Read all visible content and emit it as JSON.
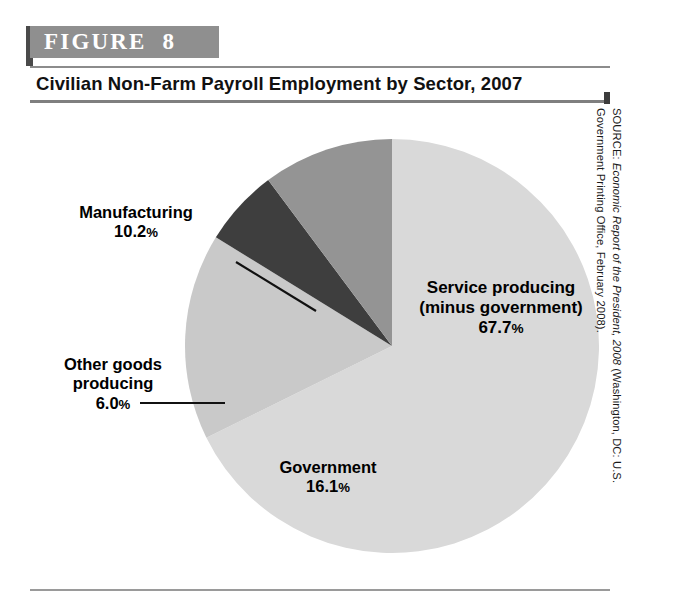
{
  "figure": {
    "banner_label": "FIGURE  8",
    "title": "Civilian Non-Farm Payroll Employment by Sector, 2007"
  },
  "source": {
    "prefix": "SOURCE: ",
    "italic_title": "Economic Report of the President, 2008",
    "rest_line1": " (Washington, DC: U.S.",
    "line2": "Government Printing Office, February 2008)."
  },
  "labels": {
    "service": {
      "line1": "Service producing",
      "line2": "(minus government)",
      "value": "67.7",
      "pct": "%"
    },
    "government": {
      "line1": "Government",
      "value": "16.1",
      "pct": "%"
    },
    "manufacturing": {
      "line1": "Manufacturing",
      "value": "10.2",
      "pct": "%"
    },
    "other_goods": {
      "line1": "Other goods",
      "line2": "producing",
      "value": "6.0",
      "pct": "%"
    }
  },
  "colors": {
    "service": "#d9d9d9",
    "government": "#c9c9c9",
    "other_goods": "#3e3e3e",
    "manufacturing": "#949494",
    "banner_bg": "#8f8f8f",
    "banner_text": "#ffffff",
    "rule": "#8c8c8c"
  },
  "chart_data": {
    "type": "pie",
    "title": "Civilian Non-Farm Payroll Employment by Sector, 2007",
    "xlabel": "",
    "ylabel": "",
    "units": "percent",
    "start_angle_deg": 0,
    "direction": "clockwise",
    "legend": "none (direct labels with leader lines)",
    "grid": false,
    "categories": [
      "Service producing (minus government)",
      "Government",
      "Other goods producing",
      "Manufacturing"
    ],
    "values": [
      67.7,
      16.1,
      6.0,
      10.2
    ],
    "slice_colors": [
      "#d9d9d9",
      "#c9c9c9",
      "#3e3e3e",
      "#949494"
    ],
    "slices": [
      {
        "label": "Service producing (minus government)",
        "value": 67.7,
        "color": "#d9d9d9",
        "start_deg": 0.0,
        "end_deg": 243.72
      },
      {
        "label": "Government",
        "value": 16.1,
        "color": "#c9c9c9",
        "start_deg": 243.72,
        "end_deg": 301.68
      },
      {
        "label": "Other goods producing",
        "value": 6.0,
        "color": "#3e3e3e",
        "start_deg": 301.68,
        "end_deg": 323.28
      },
      {
        "label": "Manufacturing",
        "value": 10.2,
        "color": "#949494",
        "start_deg": 323.28,
        "end_deg": 360.0
      }
    ],
    "total": 100.0,
    "source": "SOURCE: Economic Report of the President, 2008 (Washington, DC: U.S. Government Printing Office, February 2008)."
  }
}
